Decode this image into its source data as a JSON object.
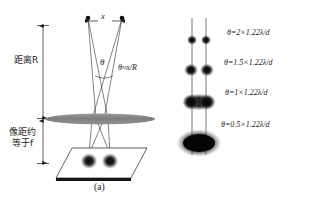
{
  "figure": {
    "background_color": "#ffffff",
    "ink_color": "#1b1b1b",
    "lens_color": "#8c8c8c"
  },
  "panel_a": {
    "caption": "(a)",
    "labels": {
      "distance_R": "距离R",
      "image_distance_line1": "像距约",
      "image_distance_line2": "等于f",
      "separation_x": "x",
      "angle_theta": "θ",
      "angle_formula": "θ≈x/R"
    },
    "elements": {
      "source_points": 2,
      "lens_shape": "ellipse",
      "detector_shape": "parallelogram",
      "image_spots": 2
    }
  },
  "panel_b": {
    "caption": "(b)",
    "rows": [
      {
        "formula": "θ=2×1.22λ/d",
        "separation": 2.0,
        "blur": "resolved"
      },
      {
        "formula": "θ=1.5×1.22λ/d",
        "separation": 1.5,
        "blur": "resolved"
      },
      {
        "formula": "θ=1×1.22λ/d",
        "separation": 1.0,
        "blur": "marginal"
      },
      {
        "formula": "θ=0.5×1.22λ/d",
        "separation": 0.5,
        "blur": "unresolved"
      }
    ]
  }
}
